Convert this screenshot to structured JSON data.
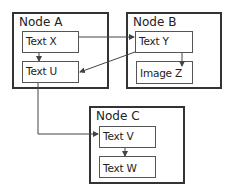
{
  "nodes": [
    {
      "id": "A",
      "title": "Node A"
    },
    {
      "id": "B",
      "title": "Node B"
    },
    {
      "id": "C",
      "title": "Node C"
    }
  ],
  "items": {
    "text_x": "Text X",
    "text_u": "Text U",
    "text_y": "Text Y",
    "image_z": "Image Z",
    "text_v": "Text V",
    "text_w": "Text W"
  },
  "edges": [
    {
      "from": "Text X",
      "to": "Text Y"
    },
    {
      "from": "Text X",
      "to": "Text U"
    },
    {
      "from": "Text Y",
      "to": "Text U"
    },
    {
      "from": "Text Y",
      "to": "Image Z"
    },
    {
      "from": "Text U",
      "to": "Text V"
    },
    {
      "from": "Text V",
      "to": "Text W"
    }
  ],
  "colors": {
    "border": "#333333",
    "item_border": "#555555",
    "arrow": "#444444"
  }
}
